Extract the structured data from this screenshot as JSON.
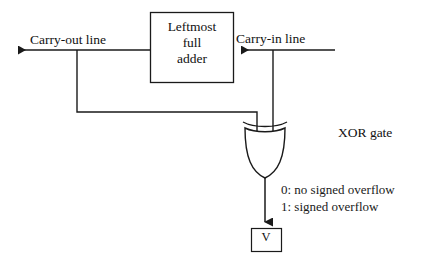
{
  "diagram": {
    "colors": {
      "background": "#ffffff",
      "stroke": "#1a1a1a",
      "text": "#111111"
    },
    "adder_block": {
      "line1": "Leftmost",
      "line2": "full",
      "line3": "adder"
    },
    "signals": {
      "carry_out_label": "Carry-out line",
      "carry_in_label": "Carry-in line"
    },
    "gate": {
      "label": "XOR gate",
      "type": "xor"
    },
    "output": {
      "line0": "0: no signed overflow",
      "line1": "1: signed overflow",
      "flag_box": "V"
    },
    "icons": {
      "arrow_left": "arrow-left-icon",
      "arrow_down": "arrow-down-icon"
    }
  }
}
